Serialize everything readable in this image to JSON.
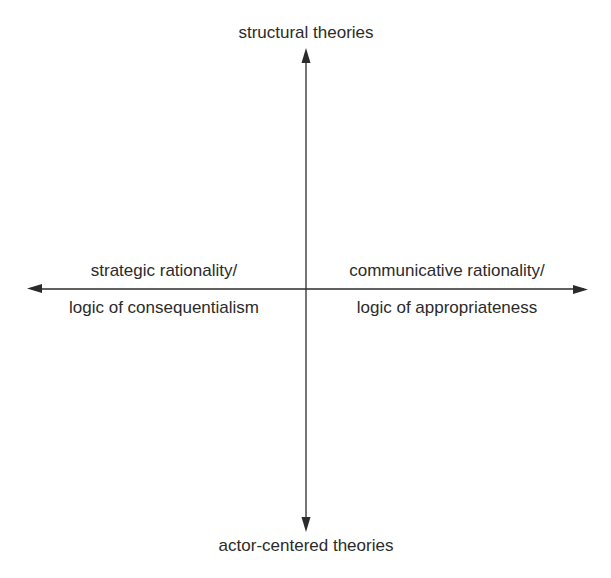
{
  "diagram": {
    "type": "quadrant-axes",
    "colors": {
      "line": "#2b2b2b",
      "text": "#2b2b2b",
      "background": "#ffffff"
    },
    "vertical_axis": {
      "top_label": "structural theories",
      "bottom_label": "actor-centered theories"
    },
    "horizontal_axis": {
      "left_label_line1": "strategic rationality/",
      "left_label_line2": "logic of consequentialism",
      "right_label_line1": "communicative rationality/",
      "right_label_line2": "logic of appropriateness"
    }
  }
}
